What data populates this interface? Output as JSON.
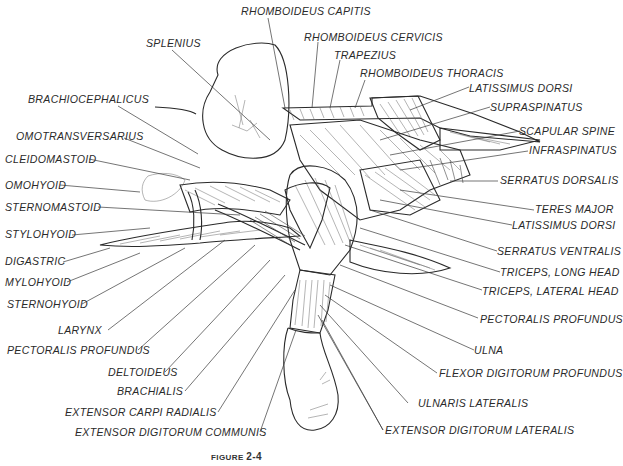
{
  "figure": {
    "caption_prefix": "FIGURE",
    "caption_number": "2-4",
    "colors": {
      "ink": "#2a2a2a",
      "background": "#ffffff",
      "shading": "#6a6a6a"
    }
  },
  "labels": {
    "rhomboideus_capitis": "RHOMBOIDEUS CAPITIS",
    "splenius": "SPLENIUS",
    "rhomboideus_cervicis": "RHOMBOIDEUS CERVICIS",
    "trapezius": "TRAPEZIUS",
    "rhomboideus_thoracis": "RHOMBOIDEUS THORACIS",
    "brachiocephalicus": "BRACHIOCEPHALICUS",
    "latissimus_dorsi_top": "LATISSIMUS DORSI",
    "supraspinatus": "SUPRASPINATUS",
    "omotransversarius": "OMOTRANSVERSARIUS",
    "scapular_spine": "SCAPULAR SPINE",
    "cleidomastoid": "CLEIDOMASTOID",
    "infraspinatus": "INFRASPINATUS",
    "omohyoid": "OMOHYOID",
    "serratus_dorsalis": "SERRATUS DORSALIS",
    "sternomastoid": "STERNOMASTOID",
    "teres_major": "TERES MAJOR",
    "stylohyoid": "STYLOHYOID",
    "latissimus_dorsi": "LATISSIMUS DORSI",
    "serratus_ventralis": "SERRATUS VENTRALIS",
    "digastric": "DIGASTRIC",
    "triceps_long_head": "TRICEPS, LONG HEAD",
    "mylohyoid": "MYLOHYOID",
    "triceps_lateral_head": "TRICEPS, LATERAL HEAD",
    "sternohyoid": "STERNOHYOID",
    "larynx": "LARYNX",
    "pectoralis_profundus_right": "PECTORALIS PROFUNDUS",
    "pectoralis_profundus_left": "PECTORALIS PROFUNDUS",
    "ulna": "ULNA",
    "deltoideus": "DELTOIDEUS",
    "flexor_digitorum_profundus": "FLEXOR DIGITORUM PROFUNDUS",
    "brachialis": "BRACHIALIS",
    "ulnaris_lateralis": "ULNARIS LATERALIS",
    "extensor_carpi_radialis": "EXTENSOR CARPI RADIALIS",
    "extensor_digitorum_lateralis": "EXTENSOR DIGITORUM LATERALIS",
    "extensor_digitorum_communis": "EXTENSOR DIGITORUM COMMUNIS"
  }
}
